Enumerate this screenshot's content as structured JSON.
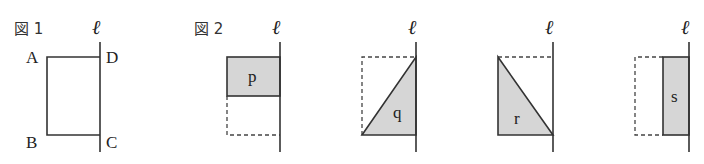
{
  "figure1": {
    "title": "図 1",
    "axis_label": "ℓ",
    "vertices": {
      "A": "A",
      "B": "B",
      "C": "C",
      "D": "D"
    }
  },
  "figure2": {
    "title": "図 2",
    "panels": [
      {
        "axis_label": "ℓ",
        "region": "p",
        "shape": "upper half rectangle"
      },
      {
        "axis_label": "ℓ",
        "region": "q",
        "shape": "lower-right triangle"
      },
      {
        "axis_label": "ℓ",
        "region": "r",
        "shape": "lower-left triangle"
      },
      {
        "axis_label": "ℓ",
        "region": "s",
        "shape": "right half rectangle"
      }
    ]
  },
  "colors": {
    "line": "#333333",
    "shade": "#d6d6d6",
    "background": "#ffffff"
  }
}
